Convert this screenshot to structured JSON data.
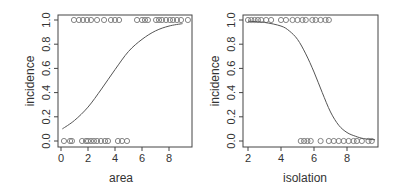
{
  "chart_data": [
    {
      "type": "scatter",
      "title": "",
      "xlabel": "area",
      "ylabel": "incidence",
      "xlim": [
        -0.2,
        9.6
      ],
      "ylim": [
        -0.04,
        1.04
      ],
      "xticks": [
        "0",
        "2",
        "4",
        "6",
        "8"
      ],
      "yticks": [
        "0.0",
        "0.2",
        "0.4",
        "0.6",
        "0.8",
        "1.0"
      ],
      "grid": false,
      "legend": null,
      "series": [
        {
          "name": "incidence = 1",
          "marker": "open-circle",
          "x": [
            0.96,
            1.33,
            1.63,
            1.93,
            2.22,
            2.67,
            3.19,
            3.7,
            4.0,
            4.3,
            5.63,
            6.0,
            6.22,
            6.44,
            7.04,
            7.26,
            7.48,
            7.78,
            8.07,
            8.3,
            8.59,
            8.89,
            9.4
          ],
          "y": [
            1,
            1,
            1,
            1,
            1,
            1,
            1,
            1,
            1,
            1,
            1,
            1,
            1,
            1,
            1,
            1,
            1,
            1,
            1,
            1,
            1,
            1,
            1
          ]
        },
        {
          "name": "incidence = 0",
          "marker": "open-circle",
          "x": [
            0.22,
            0.67,
            0.81,
            1.56,
            1.85,
            2.0,
            2.22,
            2.44,
            2.67,
            2.96,
            3.26,
            3.48,
            4.22,
            4.52,
            4.89
          ],
          "y": [
            0,
            0,
            0,
            0,
            0,
            0,
            0,
            0,
            0,
            0,
            0,
            0,
            0,
            0,
            0
          ]
        },
        {
          "name": "logistic fit",
          "type": "line",
          "x": [
            0.1,
            1,
            2,
            3,
            4,
            5,
            6,
            7,
            8,
            9
          ],
          "y": [
            0.1,
            0.17,
            0.28,
            0.43,
            0.59,
            0.74,
            0.84,
            0.91,
            0.95,
            0.97
          ]
        }
      ]
    },
    {
      "type": "scatter",
      "title": "",
      "xlabel": "isolation",
      "ylabel": "incidence",
      "xlim": [
        1.8,
        9.8
      ],
      "ylim": [
        -0.04,
        1.04
      ],
      "xticks": [
        "2",
        "4",
        "6",
        "8"
      ],
      "yticks": [
        "0.0",
        "0.2",
        "0.4",
        "0.6",
        "0.8",
        "1.0"
      ],
      "grid": false,
      "legend": null,
      "series": [
        {
          "name": "incidence = 1",
          "marker": "open-circle",
          "x": [
            2.0,
            2.2,
            2.4,
            2.6,
            2.8,
            3.1,
            3.4,
            4.0,
            4.3,
            4.7,
            5.0,
            5.3,
            5.5,
            5.9,
            6.1,
            6.4,
            6.7,
            6.9
          ],
          "y": [
            1,
            1,
            1,
            1,
            1,
            1,
            1,
            1,
            1,
            1,
            1,
            1,
            1,
            1,
            1,
            1,
            1,
            1
          ]
        },
        {
          "name": "incidence = 0",
          "marker": "open-circle",
          "x": [
            5.2,
            5.4,
            5.6,
            5.8,
            6.4,
            6.9,
            7.2,
            7.5,
            7.8,
            8.1,
            8.4,
            8.6,
            8.9,
            9.3,
            9.5
          ],
          "y": [
            0,
            0,
            0,
            0,
            0,
            0,
            0,
            0,
            0,
            0,
            0,
            0,
            0,
            0,
            0
          ]
        },
        {
          "name": "logistic fit",
          "type": "line",
          "x": [
            2,
            3,
            4,
            4.5,
            5,
            5.5,
            6,
            6.5,
            7,
            7.5,
            8,
            8.5,
            9,
            9.7
          ],
          "y": [
            0.99,
            0.98,
            0.95,
            0.91,
            0.84,
            0.72,
            0.57,
            0.4,
            0.24,
            0.13,
            0.07,
            0.04,
            0.02,
            0.01
          ]
        }
      ]
    }
  ],
  "panels": [
    {
      "xlabel": "area",
      "ylabel": "incidence"
    },
    {
      "xlabel": "isolation",
      "ylabel": "incidence"
    }
  ],
  "colors": {
    "axis": "#444444",
    "points": "#777777",
    "curve": "#555555",
    "text": "#333333"
  }
}
